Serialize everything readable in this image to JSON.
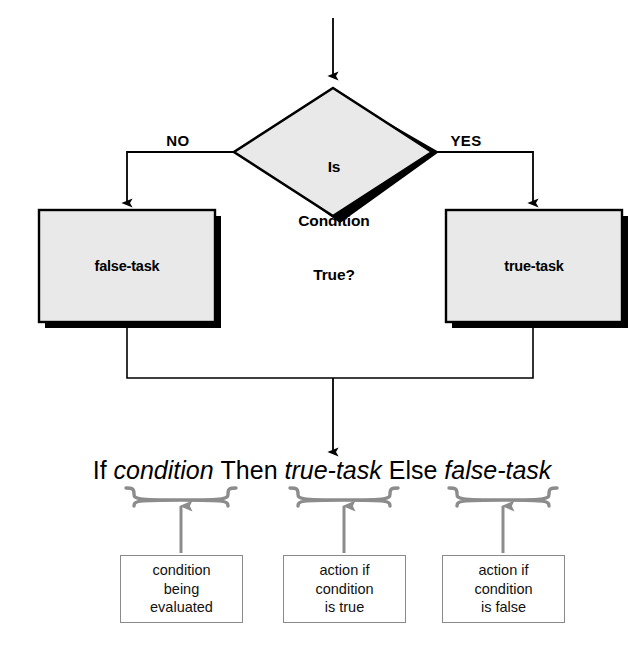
{
  "diagram": {
    "type": "flowchart",
    "colors": {
      "shape_fill": "#e9e9e9",
      "shape_stroke": "#000000",
      "shadow": "#000000",
      "connector": "#000000",
      "brace": "#8c8c8c",
      "note_border": "#8a8a8a",
      "background": "#ffffff",
      "text": "#000000"
    },
    "decision": {
      "line1": "Is",
      "line2": "Condition",
      "line3": "True?"
    },
    "branches": {
      "no_label": "NO",
      "yes_label": "YES"
    },
    "processes": {
      "false_task": "false-task",
      "true_task": "true-task"
    },
    "formula": {
      "if": "If",
      "condition": "condition",
      "then": "Then",
      "true_task": "true-task",
      "else": "Else",
      "false_task": "false-task"
    },
    "notes": [
      {
        "id": "note-condition",
        "line1": "condition",
        "line2": "being",
        "line3": "evaluated"
      },
      {
        "id": "note-true",
        "line1": "action if",
        "line2": "condition",
        "line3": "is true"
      },
      {
        "id": "note-false",
        "line1": "action if",
        "line2": "condition",
        "line3": "is false"
      }
    ]
  }
}
